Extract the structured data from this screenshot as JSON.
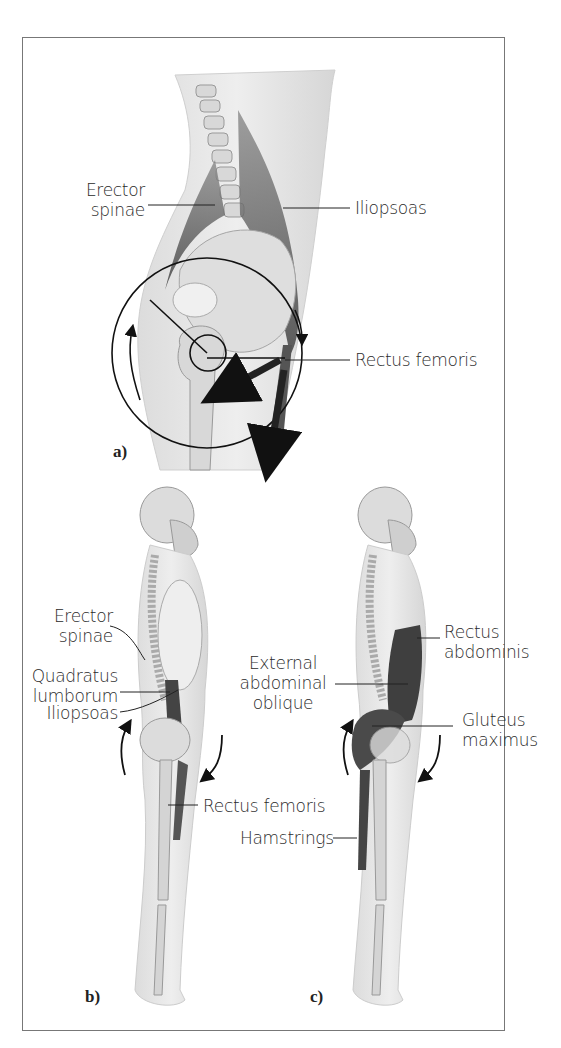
{
  "figure": {
    "panels": [
      {
        "tag": "a)",
        "labels": {
          "erector_spinae_line1": "Erector",
          "erector_spinae_line2": "spinae",
          "iliopsoas": "Iliopsoas",
          "rectus_femoris": "Rectus femoris"
        }
      },
      {
        "tag": "b)",
        "labels": {
          "erector_spinae_line1": "Erector",
          "erector_spinae_line2": "spinae",
          "quadratus_line1": "Quadratus",
          "quadratus_line2": "lumborum",
          "iliopsoas": "Iliopsoas",
          "rectus_femoris": "Rectus femoris"
        }
      },
      {
        "tag": "c)",
        "labels": {
          "rectus_abdominis_line1": "Rectus",
          "rectus_abdominis_line2": "abdominis",
          "external_oblique_line1": "External",
          "external_oblique_line2": "abdominal",
          "external_oblique_line3": "oblique",
          "gluteus_line1": "Gluteus",
          "gluteus_line2": "maximus",
          "hamstrings": "Hamstrings"
        }
      }
    ]
  },
  "colors": {
    "body_fill": "#e6e6e6",
    "bone_fill": "#d4d4d4",
    "muscle_fill": "#555555",
    "line": "#222222",
    "border": "#777777"
  }
}
